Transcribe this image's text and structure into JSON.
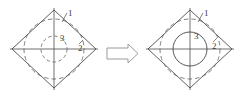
{
  "figure": {
    "type": "engineering-transformation-diagram",
    "background_color": "#ffffff",
    "line_color": "#4d4d4d",
    "dashed_color": "#6b6b6b",
    "arrow_color": "#9a9a9a",
    "label_color": "#3a3a3a",
    "caption_color": "#d8d8d8"
  },
  "left_diagram": {
    "name": "before-state",
    "shape": "diamond",
    "center": {
      "x": 54,
      "y": 49
    },
    "half_width": 42,
    "half_height": 39,
    "inscribed_arc_style": "dashed",
    "inscribed_arc_radius": 30,
    "center_circle_style": "dashed",
    "center_circle_radius": 13,
    "center_cross": true,
    "labels": [
      {
        "id": "label-1",
        "text": "1",
        "x": 68,
        "y": 14
      },
      {
        "id": "label-3",
        "text": "3",
        "x": 62,
        "y": 39
      },
      {
        "id": "label-2",
        "text": "2",
        "x": 81,
        "y": 49
      }
    ]
  },
  "right_diagram": {
    "name": "after-state",
    "shape": "diamond",
    "center": {
      "x": 190,
      "y": 49
    },
    "half_width": 42,
    "half_height": 39,
    "inscribed_arc_style": "dashed",
    "inscribed_arc_radius": 30,
    "center_circle_style": "solid",
    "center_circle_radius": 17,
    "center_cross": true,
    "labels": [
      {
        "id": "label-1",
        "text": "1",
        "x": 204,
        "y": 14
      },
      {
        "id": "label-3",
        "text": "3",
        "x": 196,
        "y": 37
      },
      {
        "id": "label-2",
        "text": "2",
        "x": 215,
        "y": 47
      }
    ]
  },
  "transform_arrow": {
    "name": "transformation-arrow",
    "direction": "right",
    "style": "hollow-block-outline",
    "x": 107,
    "y": 44,
    "width": 31,
    "height": 19
  },
  "caption": {
    "text": "",
    "visible_fragment": true
  }
}
